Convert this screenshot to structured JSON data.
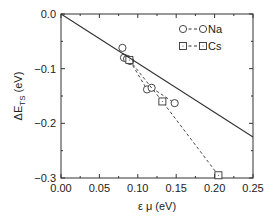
{
  "chart_data": {
    "type": "scatter",
    "title": "",
    "xlabel": "ε μ (eV)",
    "ylabel": "ΔE_TS (eV)",
    "xlim": [
      0.0,
      0.25
    ],
    "ylim": [
      -0.3,
      0.0
    ],
    "x_ticks": [
      "0.00",
      "0.05",
      "0.10",
      "0.15",
      "0.20",
      "0.25"
    ],
    "y_ticks": [
      "0.0",
      "-0.1",
      "-0.2",
      "-0.3"
    ],
    "grid": false,
    "legend_position": "upper right",
    "series": [
      {
        "name": "Na",
        "marker": "circle",
        "line": "dashed",
        "points": [
          {
            "x": 0.08,
            "y": -0.062
          },
          {
            "x": 0.082,
            "y": -0.08
          },
          {
            "x": 0.086,
            "y": -0.082
          },
          {
            "x": 0.09,
            "y": -0.086
          },
          {
            "x": 0.112,
            "y": -0.138
          },
          {
            "x": 0.118,
            "y": -0.135
          },
          {
            "x": 0.148,
            "y": -0.163
          }
        ]
      },
      {
        "name": "Cs",
        "marker": "square",
        "line": "dashed",
        "points": [
          {
            "x": 0.089,
            "y": -0.084
          },
          {
            "x": 0.132,
            "y": -0.16
          },
          {
            "x": 0.205,
            "y": -0.295
          }
        ]
      },
      {
        "name": "reference line",
        "marker": "none",
        "line": "solid",
        "points": [
          {
            "x": 0.0,
            "y": 0.0
          },
          {
            "x": 0.25,
            "y": -0.225
          }
        ]
      }
    ]
  },
  "axes": {
    "xlabel": "ε μ (eV)",
    "ylabel_main": "ΔE",
    "ylabel_sub": "TS",
    "ylabel_unit": " (eV)"
  },
  "legend": {
    "items": [
      {
        "label": "Na"
      },
      {
        "label": "Cs"
      }
    ]
  }
}
